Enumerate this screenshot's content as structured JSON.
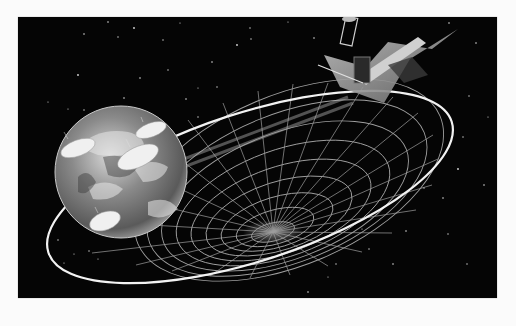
{
  "image": {
    "alt": "Illustration of a satellite in orbit beaming a wireframe parabolic coverage cone toward Earth with ground antenna dishes",
    "background_color": "#050505",
    "page_color": "#fbfbfb",
    "elements": {
      "earth": "globe with clouds and four ground antenna dishes",
      "orbit": "white elliptical orbit ring",
      "dish": "wireframe paraboloid grid",
      "satellite": "satellite with large square antenna reflector and solar panel",
      "stars": "scattered white stars"
    }
  }
}
